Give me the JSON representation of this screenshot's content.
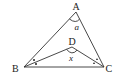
{
  "diagram": {
    "type": "geometry-triangle",
    "points": {
      "A": {
        "label": "A",
        "x": 76,
        "y": 12
      },
      "B": {
        "label": "B",
        "x": 24,
        "y": 67
      },
      "C": {
        "label": "C",
        "x": 104,
        "y": 67
      },
      "D": {
        "label": "D",
        "x": 72,
        "y": 47
      }
    },
    "segments": [
      "AB",
      "AC",
      "BC",
      "BD",
      "CD"
    ],
    "angles": {
      "A": {
        "label": "a"
      },
      "D": {
        "label": "x"
      }
    },
    "marks": {
      "B": "bisector-dots",
      "C": "bisector-triangles"
    },
    "colors": {
      "stroke": "#333333",
      "text": "#222222",
      "background": "#ffffff"
    }
  }
}
